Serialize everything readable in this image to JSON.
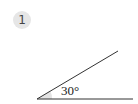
{
  "problem": {
    "number": "1"
  },
  "angle": {
    "label": "30°",
    "degrees": 30,
    "vertex": [
      37,
      99
    ],
    "horizontal_ray_end": [
      133,
      99
    ],
    "inclined_ray_end": [
      118,
      51
    ],
    "line_color": "#333333",
    "shade_color": "#e3e3e3"
  },
  "colors": {
    "badge_background": "#e6e6e6",
    "badge_text": "#444444"
  }
}
